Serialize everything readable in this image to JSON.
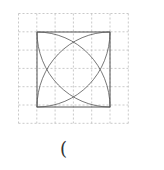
{
  "figure": {
    "grid": {
      "cols": 6,
      "rows": 6,
      "x0": 18.5,
      "y0": 13.5,
      "cell": 18.3,
      "color": "#bbbbbb"
    },
    "square": {
      "x": 37,
      "y": 32,
      "size": 73,
      "color": "#444444"
    },
    "arc_color": "#555555"
  },
  "caption": {
    "text": "("
  }
}
